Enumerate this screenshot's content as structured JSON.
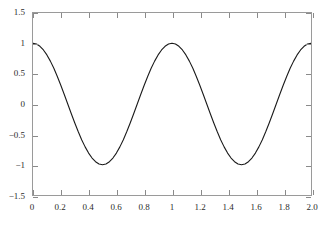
{
  "figure": {
    "background_color": "#ffffff",
    "frame_color": "#9a9a9a",
    "curve_color": "#1a1a1a"
  },
  "chart_data": {
    "type": "line",
    "title": "",
    "xlabel": "",
    "ylabel": "",
    "xlim": [
      0,
      2
    ],
    "ylim": [
      -1.5,
      1.5
    ],
    "grid": false,
    "legend": null,
    "frame": "box",
    "tick_direction": "in",
    "expression": "cos(2*pi*x)",
    "xticks": [
      0,
      0.2,
      0.4,
      0.6,
      0.8,
      1,
      1.2,
      1.4,
      1.6,
      1.8,
      2
    ],
    "xticklabels": [
      "0",
      "0.2",
      "0.4",
      "0.6",
      "0.8",
      "1",
      "1.2",
      "1.4",
      "1.6",
      "1.8",
      "2.0"
    ],
    "yticks": [
      -1.5,
      -1,
      -0.5,
      0,
      0.5,
      1,
      1.5
    ],
    "yticklabels": [
      "-1.5",
      "-1",
      "-0.5",
      "0",
      "0.5",
      "1",
      "1.5"
    ],
    "series": [
      {
        "name": "cos(2πx)",
        "color": "#1a1a1a",
        "linewidth": 1.1,
        "x": [
          0,
          0.025,
          0.05,
          0.075,
          0.1,
          0.125,
          0.15,
          0.175,
          0.2,
          0.225,
          0.25,
          0.275,
          0.3,
          0.325,
          0.35,
          0.375,
          0.4,
          0.425,
          0.45,
          0.475,
          0.5,
          0.525,
          0.55,
          0.575,
          0.6,
          0.625,
          0.65,
          0.675,
          0.7,
          0.725,
          0.75,
          0.775,
          0.8,
          0.825,
          0.85,
          0.875,
          0.9,
          0.925,
          0.95,
          0.975,
          1,
          1.025,
          1.05,
          1.075,
          1.1,
          1.125,
          1.15,
          1.175,
          1.2,
          1.225,
          1.25,
          1.275,
          1.3,
          1.325,
          1.35,
          1.375,
          1.4,
          1.425,
          1.45,
          1.475,
          1.5,
          1.525,
          1.55,
          1.575,
          1.6,
          1.625,
          1.65,
          1.675,
          1.7,
          1.725,
          1.75,
          1.775,
          1.8,
          1.825,
          1.85,
          1.875,
          1.9,
          1.925,
          1.95,
          1.975,
          2
        ],
        "y": [
          1,
          0.988,
          0.951,
          0.891,
          0.809,
          0.707,
          0.588,
          0.454,
          0.309,
          0.156,
          0,
          -0.156,
          -0.309,
          -0.454,
          -0.588,
          -0.707,
          -0.809,
          -0.891,
          -0.951,
          -0.988,
          -1,
          -0.988,
          -0.951,
          -0.891,
          -0.809,
          -0.707,
          -0.588,
          -0.454,
          -0.309,
          -0.156,
          0,
          0.156,
          0.309,
          0.454,
          0.588,
          0.707,
          0.809,
          0.891,
          0.951,
          0.988,
          1,
          0.988,
          0.951,
          0.891,
          0.809,
          0.707,
          0.588,
          0.454,
          0.309,
          0.156,
          0,
          -0.156,
          -0.309,
          -0.454,
          -0.588,
          -0.707,
          -0.809,
          -0.891,
          -0.951,
          -0.988,
          -1,
          -0.988,
          -0.951,
          -0.891,
          -0.809,
          -0.707,
          -0.588,
          -0.454,
          -0.309,
          -0.156,
          0,
          0.156,
          0.309,
          0.454,
          0.588,
          0.707,
          0.809,
          0.891,
          0.951,
          0.988,
          1
        ]
      }
    ]
  }
}
